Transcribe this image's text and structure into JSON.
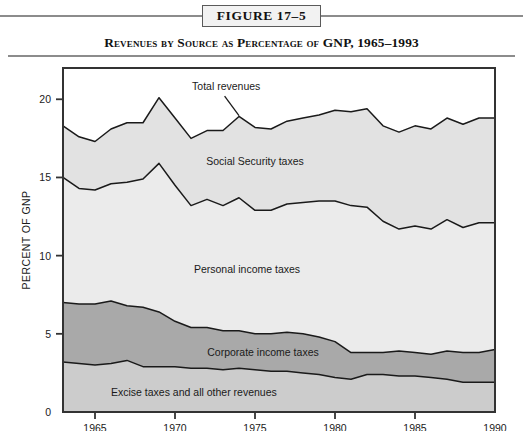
{
  "figure": {
    "box_label": "FIGURE 17–5",
    "title": "Revenues by Source as Percentage of GNP, 1965–1993"
  },
  "colors": {
    "social_security": "#e2e2e2",
    "personal_income": "#ebebeb",
    "corporate_income": "#a9a9a9",
    "excise_other": "#cccccc",
    "line": "#1a1a1a",
    "frame": "#333333",
    "rule": "#8c8c8c"
  },
  "chart_data": {
    "type": "area",
    "title": "Revenues by Source as Percentage of GNP, 1965–1993",
    "xlabel": "",
    "ylabel": "PERCENT OF GNP",
    "xlim": [
      1963,
      1990
    ],
    "ylim": [
      0,
      22
    ],
    "grid": false,
    "legend_position": "inline-band-labels",
    "xticks": [
      1965,
      1970,
      1975,
      1980,
      1985,
      1990
    ],
    "yticks": [
      0,
      5,
      10,
      15,
      20
    ],
    "stacked": true,
    "stack_order_bottom_to_top": [
      "Excise taxes and all other revenues",
      "Corporate income taxes",
      "Personal income taxes",
      "Social Security taxes"
    ],
    "x": [
      1963,
      1964,
      1965,
      1966,
      1967,
      1968,
      1969,
      1970,
      1971,
      1972,
      1973,
      1974,
      1975,
      1976,
      1977,
      1978,
      1979,
      1980,
      1981,
      1982,
      1983,
      1984,
      1985,
      1986,
      1987,
      1988,
      1989,
      1990
    ],
    "series": [
      {
        "name": "Excise taxes and all other revenues",
        "values": [
          3.2,
          3.1,
          3.0,
          3.1,
          3.3,
          2.9,
          2.9,
          2.9,
          2.8,
          2.8,
          2.7,
          2.8,
          2.7,
          2.6,
          2.6,
          2.5,
          2.4,
          2.2,
          2.1,
          2.4,
          2.4,
          2.3,
          2.3,
          2.2,
          2.1,
          1.9,
          1.9,
          1.9
        ]
      },
      {
        "name": "Corporate income taxes",
        "values": [
          3.8,
          3.8,
          3.9,
          4.0,
          3.5,
          3.8,
          3.5,
          2.9,
          2.6,
          2.6,
          2.5,
          2.4,
          2.3,
          2.4,
          2.5,
          2.5,
          2.4,
          2.3,
          1.7,
          1.4,
          1.4,
          1.6,
          1.5,
          1.5,
          1.8,
          1.9,
          1.9,
          2.1
        ]
      },
      {
        "name": "Personal income taxes",
        "values": [
          8.0,
          7.4,
          7.3,
          7.5,
          7.9,
          8.2,
          9.5,
          8.7,
          7.8,
          8.2,
          8.0,
          8.5,
          7.9,
          7.9,
          8.2,
          8.4,
          8.7,
          9.0,
          9.4,
          9.3,
          8.4,
          7.8,
          8.1,
          8.0,
          8.4,
          8.0,
          8.3,
          8.1
        ]
      },
      {
        "name": "Social Security taxes",
        "values": [
          3.3,
          3.3,
          3.1,
          3.5,
          3.8,
          3.6,
          4.2,
          4.3,
          4.3,
          4.4,
          4.8,
          5.2,
          5.3,
          5.2,
          5.3,
          5.4,
          5.5,
          5.8,
          6.0,
          6.3,
          6.1,
          6.2,
          6.4,
          6.4,
          6.5,
          6.6,
          6.7,
          6.7
        ]
      }
    ],
    "totals": [
      18.3,
      17.6,
      17.3,
      18.1,
      18.5,
      18.5,
      20.1,
      18.8,
      17.5,
      18.0,
      18.0,
      18.9,
      18.2,
      18.1,
      18.6,
      18.8,
      19.0,
      19.3,
      19.2,
      19.4,
      18.3,
      17.9,
      18.3,
      18.1,
      18.8,
      18.4,
      18.8,
      18.8
    ],
    "annotations": [
      {
        "text": "Total revenues",
        "x": 1973.2,
        "y": 20.6
      },
      {
        "text": "Social Security taxes",
        "x": 1975.0,
        "y": 15.8
      },
      {
        "text": "Personal income taxes",
        "x": 1974.5,
        "y": 8.9
      },
      {
        "text": "Corporate income taxes",
        "x": 1975.5,
        "y": 3.6
      },
      {
        "text": "Excise taxes and all other revenues",
        "x": 1966.0,
        "y": 1.0
      }
    ]
  }
}
